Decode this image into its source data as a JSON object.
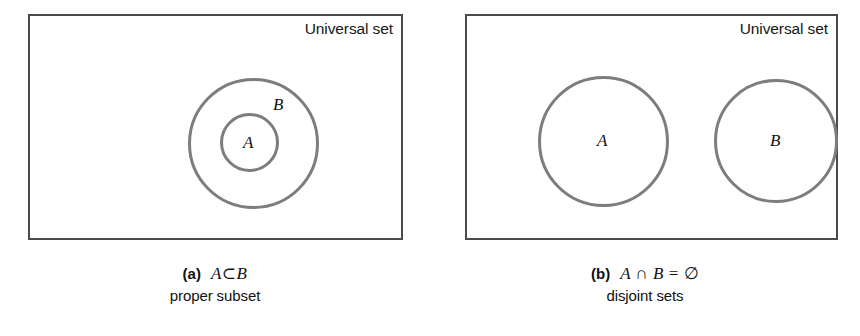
{
  "figure": {
    "stroke_color_rectangle": "#4b4b4b",
    "stroke_color_circle": "#7d7d7d",
    "background": "#ffffff"
  },
  "panels": [
    {
      "id": "a",
      "tag": "(a)",
      "universal_set_label": "Universal set",
      "expression": "A ⊂ B",
      "expression_lhs": "A",
      "expression_op": "⊂",
      "expression_rhs": "B",
      "description": "proper subset",
      "circles": [
        {
          "name": "B",
          "label": "B",
          "role": "outer-set"
        },
        {
          "name": "A",
          "label": "A",
          "role": "inner-set"
        }
      ]
    },
    {
      "id": "b",
      "tag": "(b)",
      "universal_set_label": "Universal set",
      "expression": "A ∩ B = ∅",
      "expression_lhs": "A",
      "expression_op": "∩",
      "expression_rhs": "B",
      "expression_eq": "=",
      "expression_result": "∅",
      "description": "disjoint sets",
      "circles": [
        {
          "name": "A",
          "label": "A",
          "role": "left-set"
        },
        {
          "name": "B",
          "label": "B",
          "role": "right-set"
        }
      ]
    }
  ]
}
